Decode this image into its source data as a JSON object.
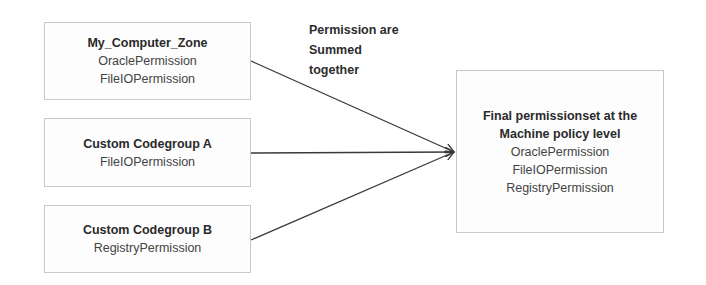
{
  "sources": [
    {
      "title": "My_Computer_Zone",
      "permissions": [
        "OraclePermission",
        "FileIOPermission"
      ]
    },
    {
      "title": "Custom Codegroup A",
      "permissions": [
        "FileIOPermission"
      ]
    },
    {
      "title": "Custom Codegroup B",
      "permissions": [
        "RegistryPermission"
      ]
    }
  ],
  "annotation": {
    "lines": [
      "Permission are",
      "Summed",
      "together"
    ]
  },
  "result": {
    "title_lines": [
      "Final permissionset at the",
      "Machine policy level"
    ],
    "permissions": [
      "OraclePermission",
      "FileIOPermission",
      "RegistryPermission"
    ]
  },
  "colors": {
    "line": "#3a3a3a",
    "border": "#c9c9c9"
  }
}
